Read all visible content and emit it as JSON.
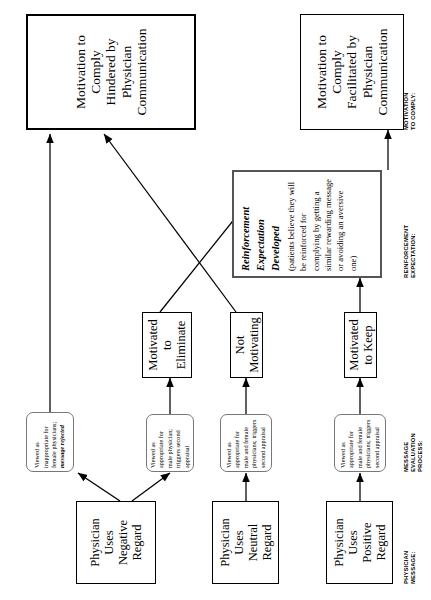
{
  "figure": {
    "type": "flowchart",
    "orientation": "rotated-90-ccw",
    "row_labels": [
      {
        "id": "physician-message",
        "text": "PHYSICIAN\nMESSAGE:"
      },
      {
        "id": "message-evaluation",
        "text": "MESSAGE\nEVALUATION\nPROCESS:"
      },
      {
        "id": "reinforcement",
        "text": "REINFORCEMENT\nEXPECTATION:"
      },
      {
        "id": "motivation",
        "text": "MOTIVATION\nTO COMPLY:"
      }
    ],
    "messages": [
      {
        "id": "positive",
        "line1": "Physician Uses",
        "line2": "Positive Regard"
      },
      {
        "id": "neutral",
        "line1": "Physician Uses",
        "line2": "Neutral Regard"
      },
      {
        "id": "negative",
        "line1": "Physician Uses",
        "line2": "Negative Regard"
      }
    ],
    "evaluations": [
      {
        "id": "eval-positive",
        "plain": "Viewed as appropriate for male and female physicians; triggers second appraisal",
        "emph": ""
      },
      {
        "id": "eval-neutral",
        "plain": "Viewed as appropriate for male and female physicians; triggers second appraisal",
        "emph": ""
      },
      {
        "id": "eval-negative-male",
        "plain": "Viewed as appropriate for male physician; triggers second appraisal",
        "emph": ""
      },
      {
        "id": "eval-negative-female",
        "plain": "Viewed as inappropriate for female physicians; ",
        "emph": "message rejected"
      }
    ],
    "motivations": [
      {
        "id": "motivated-to-keep",
        "text": "Motivated to Keep"
      },
      {
        "id": "not-motivating",
        "text": "Not Motivating"
      },
      {
        "id": "motivated-to-eliminate",
        "text": "Motivated to Eliminate"
      }
    ],
    "reinforcement": {
      "id": "reinforcement-expectation",
      "title": "Reinforcement Expectation Developed",
      "body": "(patients believe they will be reinforced for complying by getting a similar rewarding message or avoiding an aversive one)"
    },
    "outcomes": [
      {
        "id": "outcome-facilitated",
        "line1": "Motivation to Comply",
        "line2": "Facilitated by Physician",
        "line3": "Communication"
      },
      {
        "id": "outcome-hindered",
        "line1": "Motivation to Comply",
        "line2": "Hindered by Physician",
        "line3": "Communication"
      }
    ]
  },
  "colors": {
    "ink": "#000000",
    "eval_border": "#777777",
    "reinf_border": "#555555"
  }
}
